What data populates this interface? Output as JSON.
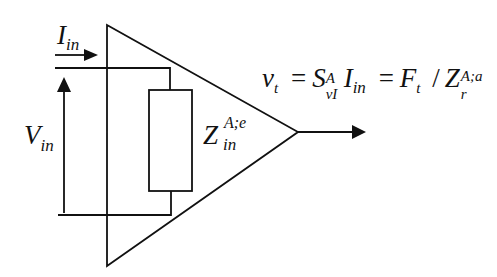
{
  "diagram": {
    "type": "amplifier-equivalent-circuit",
    "labels": {
      "input_current": {
        "main": "I",
        "sub": "in"
      },
      "input_voltage": {
        "main": "V",
        "sub": "in"
      },
      "input_impedance": {
        "main": "Z",
        "sub": "in",
        "sup": "A;e"
      }
    },
    "equation": {
      "lhs": {
        "main": "v",
        "sub": "t"
      },
      "eq1": "=",
      "term1": {
        "main": "S",
        "sub": "vI",
        "sup": "A"
      },
      "term2": {
        "main": "I",
        "sub": "in"
      },
      "eq2": "=",
      "term3": {
        "main": "F",
        "sub": "t"
      },
      "div": "/",
      "term4": {
        "main": "Z",
        "sub": "r",
        "sup": "A;a"
      }
    },
    "colors": {
      "stroke": "#111111",
      "background": "#ffffff"
    }
  }
}
